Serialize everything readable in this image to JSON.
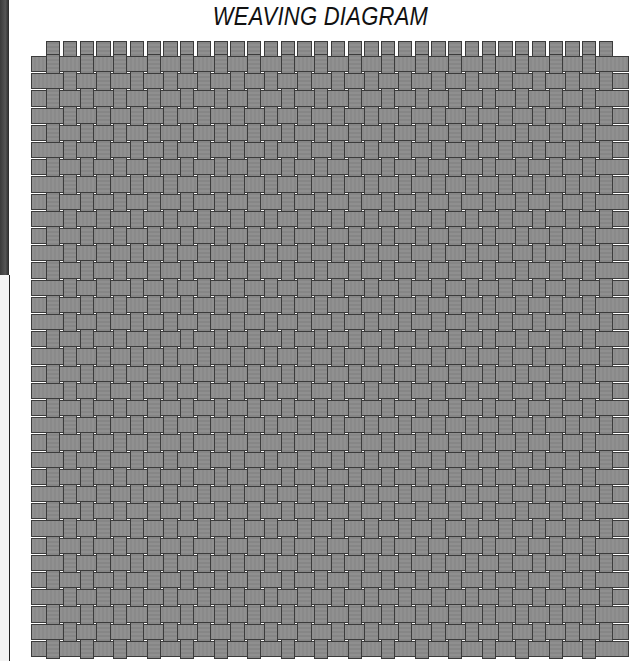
{
  "title": "WEAVING DIAGRAM",
  "diagram": {
    "type": "plain-weave",
    "columns": 34,
    "rows": 35,
    "grid_left": 31,
    "grid_right": 629,
    "col_start": 46,
    "col_pitch": 16.75,
    "row_start": 56,
    "row_pitch": 17.2,
    "tab_top": 41,
    "colors": {
      "strand_fill": "#8d8d8d",
      "strand_outline": "#3b3b3b",
      "background": "#ffffff"
    }
  }
}
